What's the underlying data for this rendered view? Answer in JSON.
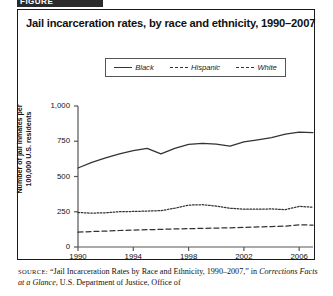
{
  "figure": {
    "banner_label": "FIGURE",
    "title": "Jail incarceration rates, by race and ethnicity, 1990–2007"
  },
  "legend": {
    "position": "top-center",
    "items": [
      {
        "label": "Black",
        "style": "solid",
        "key": "line-solid-icon"
      },
      {
        "label": "Hispanic",
        "style": "dotted",
        "key": "line-dotted-icon"
      },
      {
        "label": "White",
        "style": "dashed",
        "key": "line-dashed-icon"
      }
    ]
  },
  "source": {
    "prefix": "SOURCE:",
    "line1_rest": " “Jail Incarceration Rates by Race and Ethnicity, 1990–2007,” in",
    "line2_italic": "Corrections Facts at a Glance",
    "line2_rest": ", U.S. Department of Justice, Office of"
  },
  "chart_data": {
    "type": "line",
    "title": "Jail incarceration rates, by race and ethnicity, 1990–2007",
    "xlabel": "",
    "ylabel": "Number of jail inmates per 100,000 U.S. residents",
    "x": [
      1990,
      1991,
      1992,
      1993,
      1994,
      1995,
      1996,
      1997,
      1998,
      1999,
      2000,
      2001,
      2002,
      2003,
      2004,
      2005,
      2006,
      2007
    ],
    "xlim": [
      1990,
      2007
    ],
    "ylim": [
      0,
      1000
    ],
    "xticks": [
      1990,
      1994,
      1998,
      2002,
      2006
    ],
    "xtick_labels": [
      "1990",
      "1994",
      "1998",
      "2002",
      "2006"
    ],
    "yticks": [
      0,
      250,
      500,
      750,
      1000
    ],
    "ytick_labels": [
      "0",
      "250",
      "500",
      "750",
      "1,000"
    ],
    "grid": false,
    "legend_position": "top-center",
    "series": [
      {
        "name": "Black",
        "style": "solid",
        "color": "#333333",
        "values": [
          560,
          600,
          632,
          660,
          683,
          700,
          660,
          700,
          728,
          735,
          730,
          715,
          745,
          760,
          775,
          800,
          815,
          812
        ]
      },
      {
        "name": "Hispanic",
        "style": "dotted",
        "color": "#333333",
        "values": [
          245,
          240,
          243,
          250,
          252,
          255,
          258,
          275,
          297,
          300,
          290,
          275,
          268,
          268,
          270,
          265,
          288,
          282
        ]
      },
      {
        "name": "White",
        "style": "dashed",
        "color": "#333333",
        "values": [
          105,
          110,
          113,
          117,
          120,
          123,
          125,
          128,
          130,
          132,
          134,
          136,
          139,
          142,
          145,
          148,
          158,
          155
        ]
      }
    ]
  }
}
